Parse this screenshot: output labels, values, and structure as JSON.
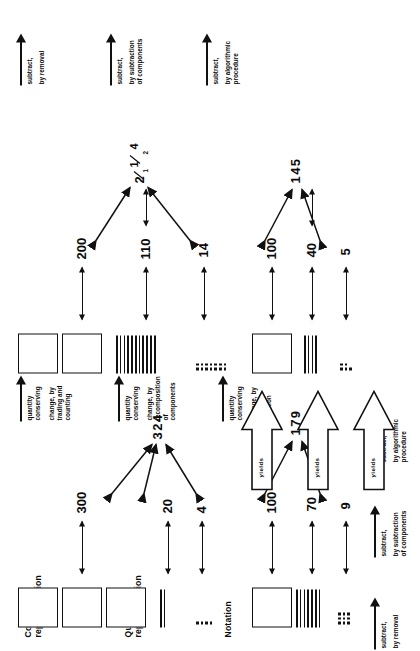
{
  "figure": {
    "caption": ""
  },
  "row_labels": [
    {
      "id": "concrete",
      "text": "Concrete\nrepresentation"
    },
    {
      "id": "quantity",
      "text": "Quantity\nrepresentation"
    },
    {
      "id": "notation",
      "text": "Notation"
    }
  ],
  "transform_labels": [
    {
      "id": "trading",
      "line1": "quantity",
      "line2": "conserving",
      "line3": "change, by",
      "line4": "trading  and",
      "line5": "counting"
    },
    {
      "id": "recomposition",
      "line1": "quantity",
      "line2": "conserving",
      "line3": "change, by",
      "line4": "recomposition",
      "line5": "of components"
    },
    {
      "id": "use-of-notation",
      "line1": "quantity",
      "line2": "conserving",
      "line3": "change, by",
      "line4": "use  of  notation",
      "line5": ""
    }
  ],
  "operation_labels": [
    {
      "id": "removal",
      "line1": "subtract,",
      "line2": "by  removal",
      "line3": ""
    },
    {
      "id": "components",
      "line1": "subtract,",
      "line2": "by  subtraction",
      "line3": "of components"
    },
    {
      "id": "algorithmic",
      "line1": "subtract,",
      "line2": "by  algorithmic",
      "line3": "procedure"
    }
  ],
  "yields_label": "yields",
  "groups": [
    {
      "id": "minuend-324",
      "position": "lower-left",
      "squares": 3,
      "lines": 2,
      "dots": 4,
      "quantities": [
        {
          "id": "q-300",
          "value": "300"
        },
        {
          "id": "q-20",
          "value": "20"
        },
        {
          "id": "q-4",
          "value": "4"
        }
      ],
      "notation": "324"
    },
    {
      "id": "minuend-324-regrouped",
      "position": "upper-left",
      "squares": 2,
      "lines": 11,
      "dots": 14,
      "quantities": [
        {
          "id": "q-200",
          "value": "200"
        },
        {
          "id": "q-110",
          "value": "110"
        },
        {
          "id": "q-14",
          "value": "14"
        }
      ],
      "notation_digits": [
        "2",
        "1",
        "1",
        "2",
        "4"
      ],
      "notation_plain": "2 11 2 4"
    },
    {
      "id": "subtrahend-145",
      "position": "upper-right",
      "squares": 1,
      "lines": 4,
      "dots": 5,
      "quantities": [
        {
          "id": "q-100a",
          "value": "100"
        },
        {
          "id": "q-40",
          "value": "40"
        },
        {
          "id": "q-5",
          "value": "5"
        }
      ],
      "notation": "145"
    },
    {
      "id": "difference-179",
      "position": "lower-right",
      "squares": 1,
      "lines": 7,
      "dots": 9,
      "quantities": [
        {
          "id": "q-100b",
          "value": "100"
        },
        {
          "id": "q-70",
          "value": "70"
        },
        {
          "id": "q-9",
          "value": "9"
        }
      ],
      "notation": "179"
    }
  ],
  "colors": {
    "ink": "#111111",
    "paper": "#ffffff"
  }
}
